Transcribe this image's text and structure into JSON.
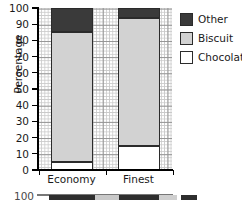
{
  "chart_data": {
    "type": "bar",
    "subtype": "stacked-percentage-bar",
    "title": "",
    "xlabel": "",
    "ylabel": "Percentage",
    "categories": [
      "Economy",
      "Finest"
    ],
    "ylim": [
      0,
      100
    ],
    "yticks": [
      0,
      10,
      20,
      30,
      40,
      50,
      60,
      70,
      80,
      90,
      100
    ],
    "ytick_labels": [
      "0",
      "10",
      "20",
      "30",
      "40",
      "50",
      "60",
      "70",
      "80",
      "90",
      "100"
    ],
    "grid": true,
    "grid_style": "graph-paper",
    "legend_position": "right",
    "series": [
      {
        "name": "Chocolate",
        "values": [
          5,
          15
        ],
        "color": "#ffffff"
      },
      {
        "name": "Biscuit",
        "values": [
          80,
          79
        ],
        "color": "#d2d2d2"
      },
      {
        "name": "Other",
        "values": [
          15,
          6
        ],
        "color": "#3a3a3a"
      }
    ],
    "segment_boundaries": {
      "Economy": {
        "Chocolate": [
          0,
          5
        ],
        "Biscuit": [
          5,
          85
        ],
        "Other": [
          85,
          100
        ]
      },
      "Finest": {
        "Chocolate": [
          0,
          15
        ],
        "Biscuit": [
          15,
          94
        ],
        "Other": [
          94,
          100
        ]
      }
    }
  },
  "legend": {
    "items": [
      {
        "label": "Other",
        "color": "#3a3a3a"
      },
      {
        "label": "Biscuit",
        "color": "#d2d2d2"
      },
      {
        "label": "Chocolate",
        "color": "#ffffff"
      }
    ]
  },
  "cropped_chart_below": {
    "top_tick_label": "100",
    "visible": true
  },
  "colors": {
    "other": "#3a3a3a",
    "biscuit": "#d2d2d2",
    "chocolate": "#ffffff",
    "outline": "#2b2b2b",
    "grid_fine": "#b9b9b9",
    "grid_major": "#8d8d8d",
    "axis": "#000000"
  }
}
